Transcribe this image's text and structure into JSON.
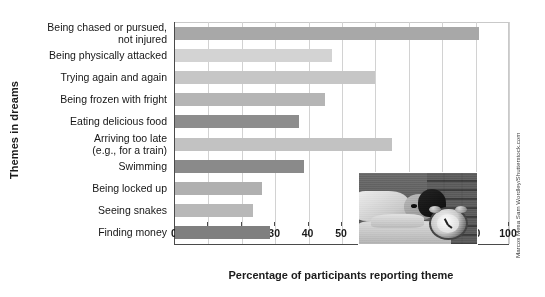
{
  "chart_data": {
    "type": "bar",
    "orientation": "horizontal",
    "title": "",
    "xlabel": "Percentage of participants reporting theme",
    "ylabel": "Themes in dreams",
    "xlim": [
      0,
      100
    ],
    "xticks": [
      0,
      10,
      20,
      30,
      40,
      50,
      60,
      70,
      80,
      90,
      100
    ],
    "grid": "vertical",
    "legend": "none",
    "categories": [
      "Being chased or pursued,\nnot injured",
      "Being physically attacked",
      "Trying again and again",
      "Being frozen with fright",
      "Eating delicious food",
      "Arriving too late\n(e.g., for a train)",
      "Swimming",
      "Being locked up",
      "Seeing snakes",
      "Finding money"
    ],
    "values": [
      91,
      47,
      60,
      45,
      37,
      65,
      38.5,
      26,
      23.5,
      28.5
    ],
    "bar_colors": [
      "#a8a8a8",
      "#d3d3d3",
      "#c6c6c6",
      "#b5b5b5",
      "#8d8d8d",
      "#c2c2c2",
      "#8a8a8a",
      "#b0b0b0",
      "#b8b8b8",
      "#7f7f7f"
    ]
  },
  "axis": {
    "x_title": "Percentage of participants reporting theme",
    "y_title": "Themes in dreams",
    "tick_labels": [
      "0",
      "10",
      "20",
      "30",
      "40",
      "50",
      "60",
      "70",
      "80",
      "90",
      "100"
    ]
  },
  "inset": {
    "name": "sleeping-person-with-alarm-clock-photo",
    "credit": "Marcos Mesa Sam Wordley/Shutterstock.com"
  },
  "colors": {
    "axis": "#4a4a4a",
    "grid": "#d2d2d2",
    "text": "#1b1b1b",
    "background": "#ffffff"
  }
}
